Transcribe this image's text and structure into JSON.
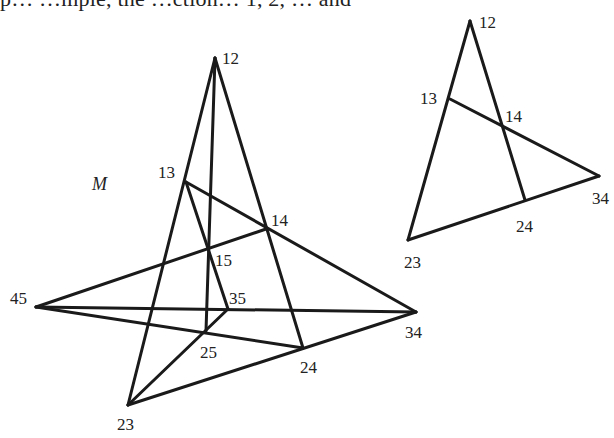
{
  "caption_fragment": "p… …mple, the …ction… 1, 2, … and",
  "left_figure": {
    "name": "M",
    "name_pos": [
      92,
      190
    ],
    "points": {
      "12": {
        "x": 215,
        "y": 58,
        "label": "12",
        "lx": 222,
        "ly": 64
      },
      "13": {
        "x": 186,
        "y": 182,
        "label": "13",
        "lx": 158,
        "ly": 178
      },
      "14": {
        "x": 266,
        "y": 229,
        "label": "14",
        "lx": 271,
        "ly": 226
      },
      "15": {
        "x": 209,
        "y": 249,
        "label": "15",
        "lx": 215,
        "ly": 266
      },
      "35": {
        "x": 228,
        "y": 309,
        "label": "35",
        "lx": 229,
        "ly": 304
      },
      "25": {
        "x": 206,
        "y": 331,
        "label": "25",
        "lx": 200,
        "ly": 358
      },
      "45": {
        "x": 36,
        "y": 307,
        "label": "45",
        "lx": 10,
        "ly": 304
      },
      "34": {
        "x": 416,
        "y": 312,
        "label": "34",
        "lx": 405,
        "ly": 338
      },
      "24": {
        "x": 303,
        "y": 348,
        "label": "24",
        "lx": 300,
        "ly": 373
      },
      "23": {
        "x": 128,
        "y": 405,
        "label": "23",
        "lx": 117,
        "ly": 430
      }
    },
    "lines": [
      [
        "12",
        "23"
      ],
      [
        "12",
        "25"
      ],
      [
        "12",
        "24"
      ],
      [
        "13",
        "34"
      ],
      [
        "13",
        "35"
      ],
      [
        "45",
        "14"
      ],
      [
        "45",
        "34"
      ],
      [
        "45",
        "24"
      ],
      [
        "23",
        "35"
      ],
      [
        "23",
        "34"
      ]
    ]
  },
  "right_figure": {
    "points": {
      "12": {
        "x": 470,
        "y": 21,
        "label": "12",
        "lx": 479,
        "ly": 28
      },
      "13": {
        "x": 450,
        "y": 99,
        "label": "13",
        "lx": 420,
        "ly": 104
      },
      "14": {
        "x": 501,
        "y": 125,
        "label": "14",
        "lx": 505,
        "ly": 122
      },
      "34": {
        "x": 599,
        "y": 176,
        "label": "34",
        "lx": 592,
        "ly": 204
      },
      "24": {
        "x": 525,
        "y": 200,
        "label": "24",
        "lx": 516,
        "ly": 232
      },
      "23": {
        "x": 408,
        "y": 240,
        "label": "23",
        "lx": 404,
        "ly": 268
      }
    },
    "lines": [
      [
        "12",
        "23"
      ],
      [
        "12",
        "24"
      ],
      [
        "13",
        "34"
      ],
      [
        "23",
        "34"
      ]
    ]
  }
}
